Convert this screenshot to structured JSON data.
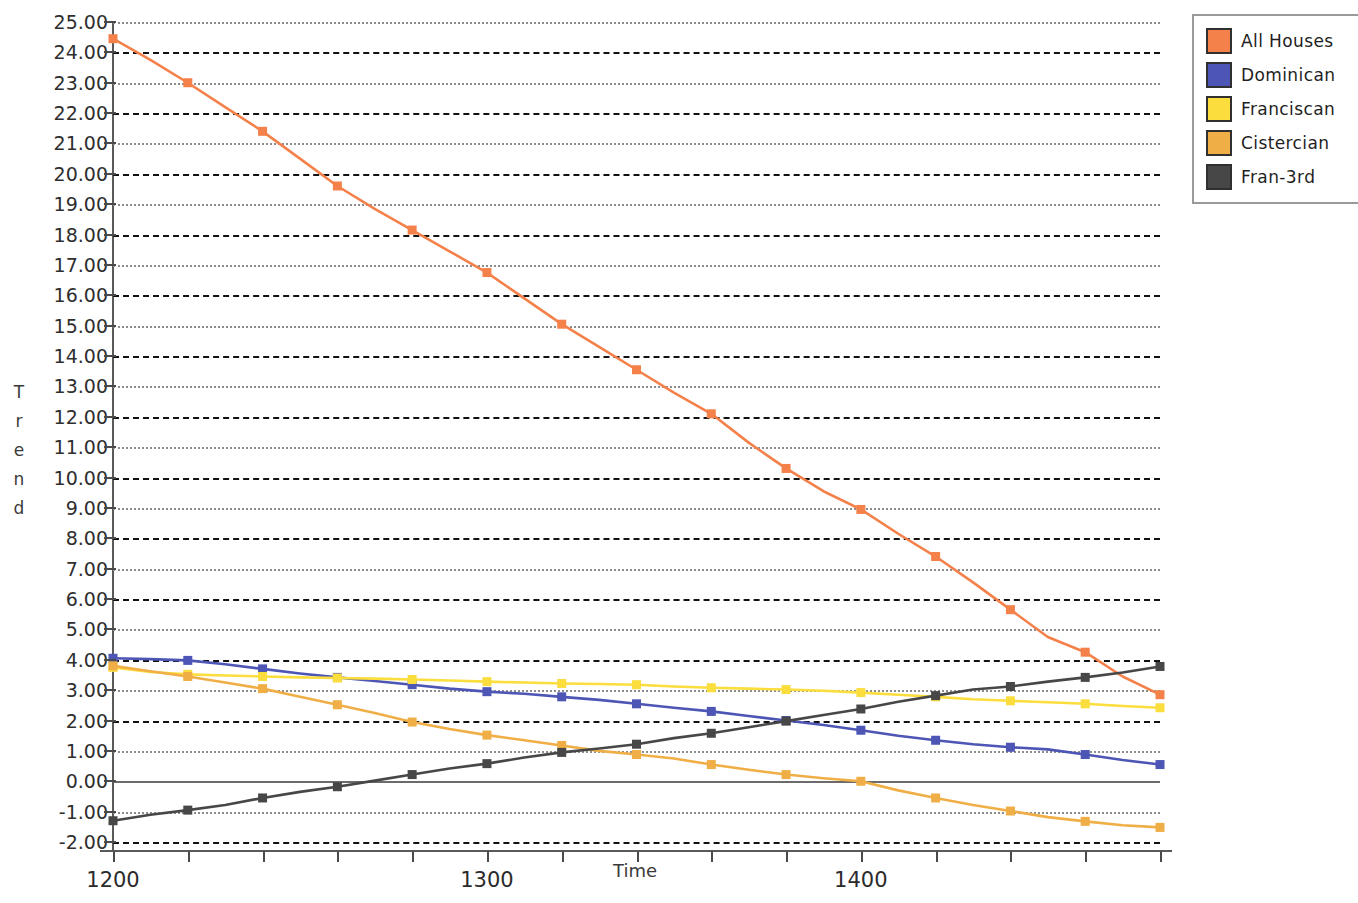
{
  "chart_data": {
    "type": "line",
    "title": "",
    "xlabel": "Time",
    "ylabel": "Trend",
    "xlim": [
      1200,
      1480
    ],
    "ylim": [
      -2,
      25
    ],
    "y_tick_step": 1,
    "x_tick_step": 20,
    "grid": true,
    "legend_position": "top-right",
    "x_tick_labels": [
      "1200",
      "1300",
      "1400"
    ],
    "x_tick_label_values": [
      1200,
      1300,
      1400
    ],
    "y_tick_labels": [
      "25.00",
      "24.00",
      "23.00",
      "22.00",
      "21.00",
      "20.00",
      "19.00",
      "18.00",
      "17.00",
      "16.00",
      "15.00",
      "14.00",
      "13.00",
      "12.00",
      "11.00",
      "10.00",
      "9.00",
      "8.00",
      "7.00",
      "6.00",
      "5.00",
      "4.00",
      "3.00",
      "2.00",
      "1.00",
      "0.00",
      "-1.00",
      "-2.00"
    ],
    "x": [
      1200,
      1210,
      1220,
      1230,
      1240,
      1250,
      1260,
      1270,
      1280,
      1290,
      1300,
      1310,
      1320,
      1330,
      1340,
      1350,
      1360,
      1370,
      1380,
      1390,
      1400,
      1410,
      1420,
      1430,
      1440,
      1450,
      1460,
      1470,
      1480
    ],
    "marker_x": [
      1200,
      1220,
      1240,
      1260,
      1280,
      1300,
      1320,
      1340,
      1360,
      1380,
      1400,
      1420,
      1440,
      1460,
      1480
    ],
    "series": [
      {
        "name": "All Houses",
        "color": "#F5814A",
        "values": [
          24.45,
          23.75,
          23.0,
          22.2,
          21.4,
          20.5,
          19.6,
          18.85,
          18.15,
          17.45,
          16.75,
          15.9,
          15.05,
          14.3,
          13.55,
          12.8,
          12.1,
          11.15,
          10.3,
          9.55,
          8.95,
          8.15,
          7.4,
          6.55,
          5.65,
          4.75,
          4.25,
          3.45,
          2.85
        ]
      },
      {
        "name": "Dominican",
        "color": "#4D55B5",
        "values": [
          4.05,
          4.02,
          3.98,
          3.85,
          3.7,
          3.55,
          3.42,
          3.3,
          3.18,
          3.05,
          2.95,
          2.88,
          2.78,
          2.68,
          2.55,
          2.42,
          2.3,
          2.15,
          2.0,
          1.85,
          1.68,
          1.5,
          1.35,
          1.22,
          1.12,
          1.05,
          0.88,
          0.7,
          0.55
        ]
      },
      {
        "name": "Franciscan",
        "color": "#FBDE3E",
        "values": [
          3.75,
          3.6,
          3.52,
          3.48,
          3.45,
          3.42,
          3.4,
          3.38,
          3.35,
          3.32,
          3.28,
          3.25,
          3.22,
          3.2,
          3.18,
          3.12,
          3.08,
          3.05,
          3.02,
          2.98,
          2.92,
          2.85,
          2.78,
          2.7,
          2.65,
          2.6,
          2.55,
          2.48,
          2.42
        ]
      },
      {
        "name": "Cistercian",
        "color": "#F0AE46",
        "values": [
          3.8,
          3.62,
          3.45,
          3.25,
          3.05,
          2.78,
          2.52,
          2.25,
          1.95,
          1.72,
          1.52,
          1.35,
          1.18,
          1.0,
          0.88,
          0.75,
          0.55,
          0.38,
          0.22,
          0.1,
          0.0,
          -0.3,
          -0.55,
          -0.78,
          -0.98,
          -1.18,
          -1.32,
          -1.45,
          -1.52
        ]
      },
      {
        "name": "Fran-3rd",
        "color": "#474747",
        "values": [
          -1.3,
          -1.1,
          -0.95,
          -0.78,
          -0.55,
          -0.35,
          -0.18,
          0.02,
          0.22,
          0.42,
          0.58,
          0.78,
          0.95,
          1.08,
          1.22,
          1.42,
          1.58,
          1.78,
          1.98,
          2.18,
          2.38,
          2.62,
          2.82,
          3.02,
          3.12,
          3.28,
          3.42,
          3.58,
          3.78
        ]
      }
    ]
  },
  "legend": {
    "items": [
      {
        "label": "All Houses",
        "color": "#F5814A"
      },
      {
        "label": "Dominican",
        "color": "#4D55B5"
      },
      {
        "label": "Franciscan",
        "color": "#FBDE3E"
      },
      {
        "label": "Cistercian",
        "color": "#F0AE46"
      },
      {
        "label": "Fran-3rd",
        "color": "#474747"
      }
    ]
  },
  "axes": {
    "y_title_letters": [
      "T",
      "r",
      "e",
      "n",
      "d"
    ],
    "x_title": "Time"
  }
}
